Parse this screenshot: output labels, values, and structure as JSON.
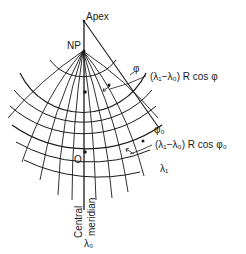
{
  "diagram": {
    "type": "conic-projection-graticule",
    "labels": {
      "apex": "Apex",
      "north_pole": "NP",
      "parallel_phi": "φ",
      "parallel_phi0": "φ₀",
      "arc_length_phi": "(λ₁−λ₀) R cos φ",
      "arc_length_phi0": "(λ₁−λ₀) R cos φ₀",
      "meridian_lambda1": "λ₁",
      "origin": "O",
      "central_label_line1": "Central",
      "central_label_line2": "meridian",
      "central_meridian_lambda0": "λ₀"
    },
    "colors": {
      "ink": "#1a1a1a",
      "background": "#ffffff"
    }
  }
}
